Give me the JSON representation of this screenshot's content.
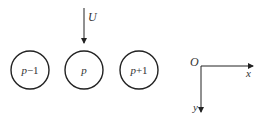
{
  "diagram": {
    "flow": {
      "label": "U",
      "direction": "down"
    },
    "particles": [
      {
        "id": "p-minus-1",
        "var": "p",
        "suffix": "−1"
      },
      {
        "id": "p",
        "var": "p",
        "suffix": ""
      },
      {
        "id": "p-plus-1",
        "var": "p",
        "suffix": "+1"
      }
    ],
    "axes": {
      "origin_label": "O",
      "x_label": "x",
      "y_label": "y"
    },
    "colors": {
      "stroke": "#222222",
      "text": "#333333"
    }
  }
}
